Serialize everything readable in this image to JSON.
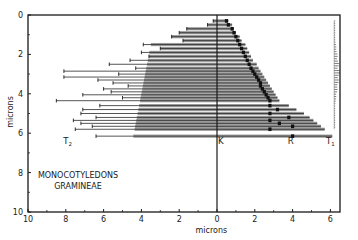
{
  "chart_data": {
    "type": "bar",
    "subtype": "horizontal-range-bars",
    "title_lines": [
      "MONOCOTYLEDONS",
      "GRAMINEAE"
    ],
    "xlabel": "microns",
    "ylabel": "microns",
    "xlim": [
      10,
      -6.4
    ],
    "ylim": [
      0,
      10
    ],
    "x_ticks": [
      {
        "value": 10,
        "label": "10"
      },
      {
        "value": 8,
        "label": "8"
      },
      {
        "value": 6,
        "label": "6"
      },
      {
        "value": 4,
        "label": "4"
      },
      {
        "value": 2,
        "label": "2"
      },
      {
        "value": 0,
        "label": "0"
      },
      {
        "value": -2,
        "label": "2"
      },
      {
        "value": -4,
        "label": "4"
      },
      {
        "value": -6,
        "label": "6"
      }
    ],
    "y_ticks": [
      {
        "value": 0,
        "label": "0"
      },
      {
        "value": 2,
        "label": "2"
      },
      {
        "value": 4,
        "label": "4"
      },
      {
        "value": 6,
        "label": "6"
      },
      {
        "value": 8,
        "label": "8"
      },
      {
        "value": 10,
        "label": "10"
      }
    ],
    "annotations": [
      {
        "text": "T",
        "sub": "2",
        "x": 7.9,
        "y": 6.4
      },
      {
        "text": "K",
        "x": -0.2,
        "y": 6.4
      },
      {
        "text": "R",
        "x": -3.9,
        "y": 6.4
      },
      {
        "text": "T",
        "sub": "1",
        "x": -6.0,
        "y": 6.4
      }
    ],
    "reference_line": {
      "label": "K",
      "x": 0
    },
    "grid": false,
    "legend": null,
    "series": [
      {
        "name": "ranges",
        "note": "each bar spans left end (T2 side) to right end (T1 side); marker = position of R dot",
        "bars": [
          {
            "y": 0.3,
            "left": 0.2,
            "right": 0.6,
            "mark": 0.5
          },
          {
            "y": 0.5,
            "left": 0.5,
            "right": 0.8,
            "mark": 0.6
          },
          {
            "y": 0.7,
            "left": 1.6,
            "right": 0.9,
            "mark": 0.8
          },
          {
            "y": 0.9,
            "left": 2.0,
            "right": 1.0,
            "mark": 0.9
          },
          {
            "y": 1.1,
            "left": 2.4,
            "right": 1.2,
            "mark": 1.0
          },
          {
            "y": 1.3,
            "left": 1.8,
            "right": 1.3,
            "mark": 1.1
          },
          {
            "y": 1.5,
            "left": 3.9,
            "right": 1.5,
            "mark": 1.2
          },
          {
            "y": 1.7,
            "left": 3.0,
            "right": 1.6,
            "mark": 1.3
          },
          {
            "y": 1.9,
            "left": 4.0,
            "right": 1.7,
            "mark": 1.4
          },
          {
            "y": 2.1,
            "left": 3.6,
            "right": 1.8,
            "mark": 1.5
          },
          {
            "y": 2.3,
            "left": 4.6,
            "right": 1.9,
            "mark": 1.6
          },
          {
            "y": 2.5,
            "left": 5.7,
            "right": 2.1,
            "mark": 1.7
          },
          {
            "y": 2.7,
            "left": 4.3,
            "right": 2.2,
            "mark": 1.8
          },
          {
            "y": 2.85,
            "left": 8.1,
            "right": 2.3,
            "mark": 1.9
          },
          {
            "y": 3.0,
            "left": 5.2,
            "right": 2.4,
            "mark": 2.0
          },
          {
            "y": 3.15,
            "left": 8.1,
            "right": 2.5,
            "mark": 2.1
          },
          {
            "y": 3.3,
            "left": 6.3,
            "right": 2.6,
            "mark": 2.2
          },
          {
            "y": 3.45,
            "left": 5.5,
            "right": 2.7,
            "mark": 2.3
          },
          {
            "y": 3.6,
            "left": 4.7,
            "right": 2.8,
            "mark": 2.3
          },
          {
            "y": 3.75,
            "left": 6.0,
            "right": 2.9,
            "mark": 2.4
          },
          {
            "y": 3.9,
            "left": 5.6,
            "right": 3.0,
            "mark": 2.5
          },
          {
            "y": 4.05,
            "left": 7.1,
            "right": 3.1,
            "mark": 2.6
          },
          {
            "y": 4.2,
            "left": 5.0,
            "right": 3.2,
            "mark": 2.7
          },
          {
            "y": 4.35,
            "left": 8.5,
            "right": 3.3,
            "mark": 2.8
          },
          {
            "y": 4.6,
            "left": 6.2,
            "right": 3.8,
            "mark": 2.8
          },
          {
            "y": 4.8,
            "left": 7.1,
            "right": 4.2,
            "mark": 3.2
          },
          {
            "y": 5.0,
            "left": 7.2,
            "right": 4.6,
            "mark": 2.8
          },
          {
            "y": 5.2,
            "left": 6.4,
            "right": 4.9,
            "mark": 3.8
          },
          {
            "y": 5.35,
            "left": 7.6,
            "right": 5.1,
            "mark": 2.8
          },
          {
            "y": 5.5,
            "left": 7.2,
            "right": 5.3,
            "mark": 3.3
          },
          {
            "y": 5.65,
            "left": 6.6,
            "right": 5.5,
            "mark": 4.0
          },
          {
            "y": 5.8,
            "left": 7.5,
            "right": 5.7,
            "mark": 2.8
          },
          {
            "y": 6.15,
            "left": 6.4,
            "right": 6.1,
            "mark": 4.0
          }
        ]
      },
      {
        "name": "T1 distribution",
        "x": -6.2,
        "y_range": [
          0.3,
          5.8
        ]
      }
    ]
  }
}
